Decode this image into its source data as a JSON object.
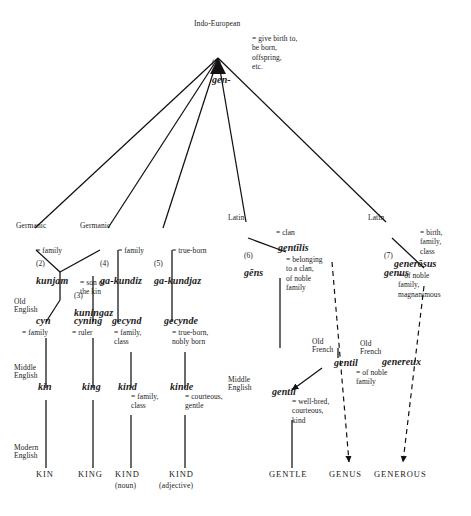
{
  "diagram": {
    "root": {
      "era": "Indo-European",
      "number": "(1)",
      "word": "gen-",
      "gloss": "= give birth to,\nbe born,\noffspring,\netc."
    },
    "branches": [
      {
        "era": "Germanic",
        "number": "(2)",
        "word": "kunjam",
        "gloss": "= family"
      },
      {
        "era": "Germanic",
        "number": "(4)",
        "word": "ga-kundiz",
        "gloss": "= family"
      },
      {
        "era": "",
        "number": "(5)",
        "word": "ga-kundjaz",
        "gloss": "= true-born"
      },
      {
        "era": "Latin",
        "number": "(6)",
        "word": "gēns",
        "gloss": "= clan"
      },
      {
        "era": "Latin",
        "number": "(7)",
        "word": "genus",
        "gloss": "= birth,\nfamily,\nclass"
      }
    ],
    "sub_germanic": {
      "number": "(3)",
      "word": "kuningaz",
      "gloss": "= son of\nthe kin"
    },
    "latin_derived": {
      "word": "gentīlis",
      "gloss": "= belonging\nto a clan,\nof noble\nfamily"
    },
    "latin_derived2": {
      "word": "generōsus",
      "gloss": "= of noble\nfamily,\nmagnanimous"
    },
    "old_english": {
      "era": "Old\nEnglish",
      "items": [
        {
          "word": "cyn",
          "gloss": "= family"
        },
        {
          "word": "cyning",
          "gloss": "= ruler"
        },
        {
          "word": "gecynd",
          "gloss": "= family,\nclass"
        },
        {
          "word": "gecynde",
          "gloss": "= true-born,\nnobly born"
        }
      ]
    },
    "old_french1": {
      "era": "Old\nFrench",
      "word": "gentil",
      "gloss": "= of noble\nfamily"
    },
    "old_french2": {
      "era": "Old\nFrench",
      "word": "genereux",
      "gloss": ""
    },
    "middle_english": {
      "era": "Middle\nEnglish",
      "items": [
        {
          "word": "kin",
          "gloss": ""
        },
        {
          "word": "king",
          "gloss": ""
        },
        {
          "word": "kind",
          "gloss": "= family,\nclass"
        },
        {
          "word": "kinde",
          "gloss": "= courteous,\ngentle"
        }
      ]
    },
    "middle_english2": {
      "era": "Middle\nEnglish",
      "word": "gentil",
      "gloss": "= well-bred,\ncourteous,\nkind"
    },
    "modern_english": {
      "era": "Modern\nEnglish",
      "items": [
        {
          "word": "KIN",
          "pos": ""
        },
        {
          "word": "KING",
          "pos": ""
        },
        {
          "word": "KIND",
          "pos": "(noun)"
        },
        {
          "word": "KIND",
          "pos": "(adjective)"
        },
        {
          "word": "GENTLE",
          "pos": ""
        },
        {
          "word": "GENUS",
          "pos": ""
        },
        {
          "word": "GENEROUS",
          "pos": ""
        }
      ]
    },
    "colors": {
      "line": "#111111",
      "text": "#1a1a1a",
      "background": "#ffffff"
    }
  }
}
